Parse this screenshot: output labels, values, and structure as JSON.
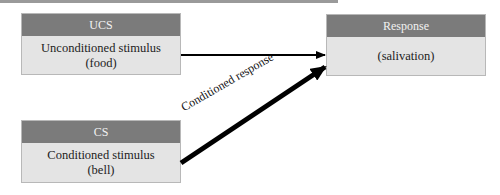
{
  "diagram": {
    "title_bar": "",
    "nodes": {
      "ucs": {
        "header": "UCS",
        "line1": "Unconditioned stimulus",
        "line2": "(food)"
      },
      "cs": {
        "header": "CS",
        "line1": "Conditioned stimulus",
        "line2": "(bell)"
      },
      "response": {
        "header": "Response",
        "line1": "(salivation)"
      }
    },
    "edges": [
      {
        "from": "ucs",
        "to": "response",
        "label": "",
        "style": "thin"
      },
      {
        "from": "cs",
        "to": "response",
        "label": "Conditioned response",
        "style": "thick"
      }
    ],
    "colors": {
      "header": "#7b7b7b",
      "body": "#e4e4e4",
      "arrow": "#000000"
    }
  }
}
